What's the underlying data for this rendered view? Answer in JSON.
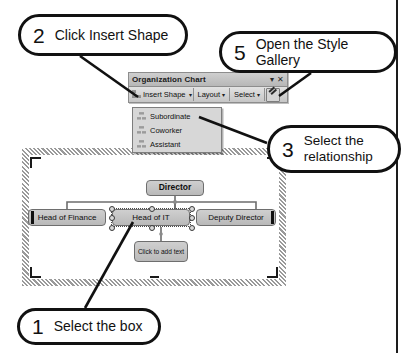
{
  "callouts": [
    {
      "id": "callout-1",
      "number": "1",
      "text": "Select the box"
    },
    {
      "id": "callout-2",
      "number": "2",
      "text": "Click Insert Shape"
    },
    {
      "id": "callout-3",
      "number": "3",
      "text_line1": "Select the",
      "text_line2": "relationship"
    },
    {
      "id": "callout-5",
      "number": "5",
      "text": "Open the Style Gallery"
    }
  ],
  "toolbar": {
    "title": "Organization Chart",
    "title_dropdown_icon": "▾",
    "close_icon": "✕",
    "insert_shape_label": "Insert Shape",
    "insert_shape_caret": "▾",
    "layout_label": "Layout",
    "layout_caret": "▾",
    "select_label": "Select",
    "select_caret": "▾",
    "style_gallery_icon": "autoformat-pencil-icon"
  },
  "menu": {
    "items": [
      {
        "label": "Subordinate",
        "icon": "subordinate-icon"
      },
      {
        "label": "Coworker",
        "icon": "coworker-icon"
      },
      {
        "label": "Assistant",
        "icon": "assistant-icon"
      }
    ]
  },
  "org_chart": {
    "director": "Director",
    "head_of_finance": "Head of Finance",
    "head_of_it": "Head of IT",
    "deputy_director": "Deputy Director",
    "placeholder": "Click to add text"
  },
  "colors": {
    "ink": "#111111",
    "node_fill": "#c4c4c4",
    "node_border": "#6e6e6e",
    "toolbar_face": "#cfcfcf",
    "menu_face": "#d7d7d7"
  }
}
